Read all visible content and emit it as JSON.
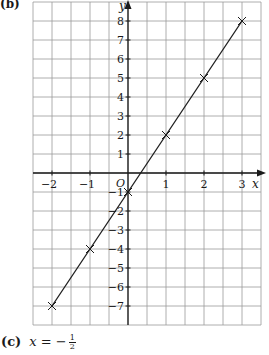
{
  "part_b_label": "(b)",
  "part_c": {
    "label": "(c)",
    "variable": "x",
    "equals": "=",
    "sign": "−",
    "numerator": "1",
    "denominator": "2"
  },
  "chart_data": {
    "type": "line",
    "title": "",
    "xlabel": "x",
    "ylabel": "y",
    "origin_label": "O",
    "xlim": [
      -2.5,
      3.5
    ],
    "ylim": [
      -8,
      9
    ],
    "x_ticks": [
      -2,
      -1,
      1,
      2,
      3
    ],
    "x_tick_labels": [
      "−2",
      "−1",
      "1",
      "2",
      "3"
    ],
    "y_ticks": [
      8,
      7,
      6,
      5,
      4,
      3,
      2,
      1,
      -1,
      -2,
      -3,
      -4,
      -5,
      -6,
      -7
    ],
    "y_tick_labels": [
      "8",
      "7",
      "6",
      "5",
      "4",
      "3",
      "2",
      "1",
      "−1",
      "−2",
      "−3",
      "−4",
      "−5",
      "−6",
      "−7"
    ],
    "grid": true,
    "grid_step_x": 0.5,
    "grid_step_y": 1,
    "series": [
      {
        "name": "y = 3x − 1",
        "marker": "x",
        "x": [
          -2,
          -1,
          0,
          1,
          2,
          3
        ],
        "y": [
          -7,
          -4,
          -1,
          2,
          5,
          8
        ]
      }
    ],
    "colors": {
      "axis": "#1a1a1a",
      "grid": "#9a9a9a",
      "line": "#1a1a1a"
    }
  }
}
